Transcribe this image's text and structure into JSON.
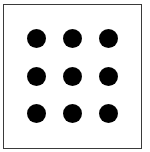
{
  "figure": {
    "rows": 3,
    "cols": 3,
    "dot_color": "#000000",
    "frame_color": "#3a3a3a",
    "background": "#ffffff",
    "dots": [
      {
        "row": 1,
        "col": 1,
        "cx": 36,
        "cy": 38
      },
      {
        "row": 1,
        "col": 2,
        "cx": 72,
        "cy": 38
      },
      {
        "row": 1,
        "col": 3,
        "cx": 108,
        "cy": 38
      },
      {
        "row": 2,
        "col": 1,
        "cx": 36,
        "cy": 76
      },
      {
        "row": 2,
        "col": 2,
        "cx": 72,
        "cy": 76
      },
      {
        "row": 2,
        "col": 3,
        "cx": 108,
        "cy": 76
      },
      {
        "row": 3,
        "col": 1,
        "cx": 36,
        "cy": 113
      },
      {
        "row": 3,
        "col": 2,
        "cx": 72,
        "cy": 113
      },
      {
        "row": 3,
        "col": 3,
        "cx": 108,
        "cy": 113
      }
    ]
  }
}
